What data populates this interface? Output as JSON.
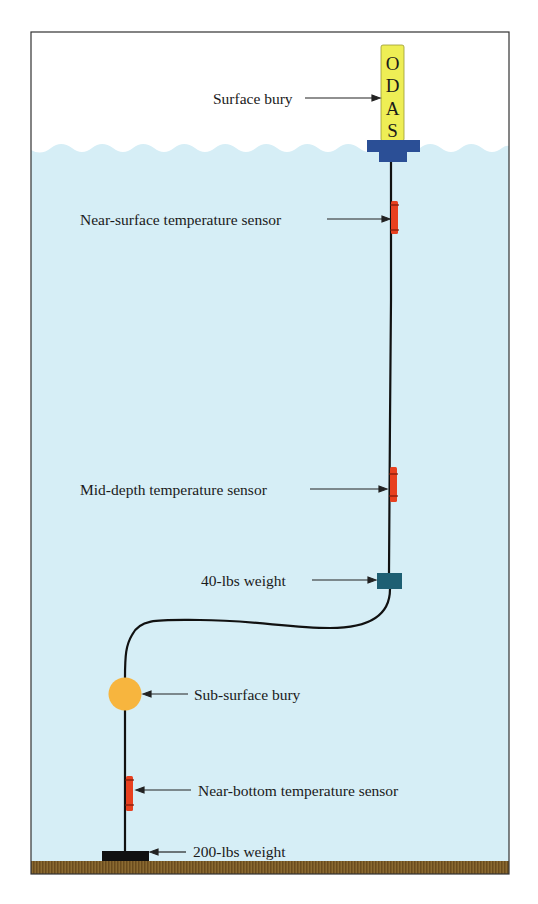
{
  "diagram": {
    "colors": {
      "sky": "#ffffff",
      "water": "#d6eef6",
      "ground": "#7a5a26",
      "frame": "#333333",
      "buoy_yellow": "#eeee55",
      "buoy_base": "#2b4f96",
      "sensor_red": "#e8401f",
      "weight_40": "#1e5f73",
      "sub_buoy": "#f7b53e",
      "weight_200": "#111111",
      "mooring_line": "#111111"
    },
    "surface_buoy": {
      "letters": [
        "O",
        "D",
        "A",
        "S"
      ]
    },
    "labels": {
      "surface_bury": "Surface bury",
      "near_surface_sensor": "Near-surface temperature sensor",
      "mid_depth_sensor": "Mid-depth temperature sensor",
      "weight_40": "40-lbs weight",
      "sub_surface_bury": "Sub-surface bury",
      "near_bottom_sensor": "Near-bottom temperature sensor",
      "weight_200": "200-lbs weight"
    }
  }
}
